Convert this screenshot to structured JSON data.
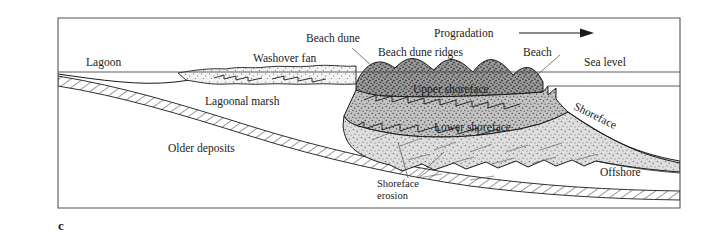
{
  "figure": {
    "caption_letter": "c"
  },
  "labels": {
    "lagoon": "Lagoon",
    "washover_fan": "Washover fan",
    "beach_dune": "Beach dune",
    "beach_dune_ridges": "Beach dune ridges",
    "beach": "Beach",
    "progradation": "Progradation",
    "sea_level": "Sea level",
    "lagoonal_marsh": "Lagoonal marsh",
    "upper_shoreface": "Upper shoreface",
    "lower_shoreface": "Lower shoreface",
    "shoreface": "Shoreface",
    "offshore": "Offshore",
    "older_deposits": "Older deposits",
    "shoreface_erosion_line1": "Shoreface",
    "shoreface_erosion_line2": "erosion"
  },
  "colors": {
    "background": "#ffffff",
    "ink": "#1a1a1a",
    "frame": "#555555",
    "dune_fill": "#8e8e8e",
    "upper_shoreface_fill": "#b8b8b8",
    "lower_shoreface_fill": "#d8d8d8",
    "washover_fill": "#f0f0f0",
    "hatch_stroke": "#333333"
  },
  "units": [
    {
      "name": "washover-fan",
      "label": "Washover fan",
      "pattern": "fine-stipple"
    },
    {
      "name": "beach-dune-ridges",
      "label": "Beach dune ridges",
      "pattern": "dark-stipple"
    },
    {
      "name": "upper-shoreface",
      "label": "Upper shoreface",
      "pattern": "medium-stipple"
    },
    {
      "name": "lower-shoreface",
      "label": "Lower shoreface",
      "pattern": "light-stipple"
    },
    {
      "name": "older-deposits",
      "label": "Older deposits",
      "pattern": "diagonal-hatch"
    }
  ]
}
